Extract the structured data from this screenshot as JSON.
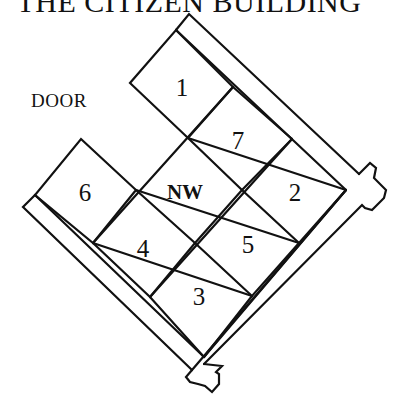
{
  "title": "THE CITIZEN BUILDING",
  "door_label": "DOOR",
  "rooms": [
    {
      "id": "1",
      "label": "1"
    },
    {
      "id": "7",
      "label": "7"
    },
    {
      "id": "2",
      "label": "2"
    },
    {
      "id": "6",
      "label": "6"
    },
    {
      "id": "nw",
      "label": "NW"
    },
    {
      "id": "5",
      "label": "5"
    },
    {
      "id": "4",
      "label": "4"
    },
    {
      "id": "3",
      "label": "3"
    }
  ],
  "colors": {
    "line": "#111111",
    "background": "#ffffff"
  }
}
